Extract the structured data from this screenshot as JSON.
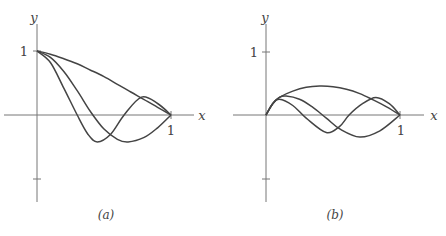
{
  "chart_data": [
    {
      "type": "line",
      "panel_label": "(a)",
      "xlabel": "x",
      "ylabel": "y",
      "x_ticks": [
        "1"
      ],
      "y_ticks": [
        "1",
        "-1"
      ],
      "y_tick_labels_shown": [
        "1"
      ],
      "xlim": [
        0,
        1
      ],
      "ylim": [
        -1.3,
        1.5
      ],
      "grid": false,
      "series": [
        {
          "name": "curve-1",
          "x": [
            0,
            0.1,
            0.2,
            0.3,
            0.4,
            0.5,
            0.6,
            0.7,
            0.8,
            0.9,
            1.0
          ],
          "y": [
            1.0,
            0.95,
            0.88,
            0.8,
            0.7,
            0.6,
            0.48,
            0.36,
            0.24,
            0.12,
            0.0
          ]
        },
        {
          "name": "curve-2",
          "x": [
            0,
            0.1,
            0.2,
            0.3,
            0.4,
            0.5,
            0.6,
            0.68,
            0.8,
            0.9,
            1.0
          ],
          "y": [
            1.0,
            0.9,
            0.68,
            0.38,
            0.05,
            -0.22,
            -0.38,
            -0.42,
            -0.35,
            -0.2,
            0.0
          ]
        },
        {
          "name": "curve-3",
          "x": [
            0,
            0.1,
            0.2,
            0.3,
            0.38,
            0.45,
            0.55,
            0.65,
            0.78,
            0.9,
            1.0
          ],
          "y": [
            1.0,
            0.82,
            0.42,
            0.0,
            -0.3,
            -0.42,
            -0.3,
            0.0,
            0.28,
            0.18,
            0.0
          ]
        }
      ]
    },
    {
      "type": "line",
      "panel_label": "(b)",
      "xlabel": "x",
      "ylabel": "y",
      "x_ticks": [
        "1"
      ],
      "y_ticks": [
        "1",
        "-1"
      ],
      "y_tick_labels_shown": [
        "1"
      ],
      "xlim": [
        0,
        1
      ],
      "ylim": [
        -1.3,
        1.5
      ],
      "grid": false,
      "series": [
        {
          "name": "curve-1",
          "x": [
            0,
            0.05,
            0.1,
            0.2,
            0.3,
            0.4,
            0.5,
            0.6,
            0.7,
            0.8,
            0.9,
            1.0
          ],
          "y": [
            0.0,
            0.18,
            0.28,
            0.38,
            0.44,
            0.46,
            0.45,
            0.41,
            0.34,
            0.24,
            0.13,
            0.0
          ]
        },
        {
          "name": "curve-2",
          "x": [
            0,
            0.05,
            0.1,
            0.15,
            0.25,
            0.35,
            0.45,
            0.55,
            0.7,
            0.85,
            1.0
          ],
          "y": [
            0.0,
            0.18,
            0.28,
            0.3,
            0.25,
            0.12,
            -0.05,
            -0.22,
            -0.35,
            -0.25,
            0.0
          ]
        },
        {
          "name": "curve-3",
          "x": [
            0,
            0.05,
            0.1,
            0.2,
            0.3,
            0.45,
            0.55,
            0.62,
            0.72,
            0.82,
            0.92,
            1.0
          ],
          "y": [
            0.0,
            0.18,
            0.25,
            0.15,
            -0.05,
            -0.28,
            -0.18,
            0.0,
            0.18,
            0.28,
            0.18,
            0.0
          ]
        }
      ]
    }
  ],
  "panels": [
    {
      "caption": "(a)",
      "x_axis_label": "x",
      "y_axis_label": "y",
      "y_one_label": "1",
      "x_one_label": "1"
    },
    {
      "caption": "(b)",
      "x_axis_label": "x",
      "y_axis_label": "y",
      "y_one_label": "1",
      "x_one_label": "1"
    }
  ]
}
